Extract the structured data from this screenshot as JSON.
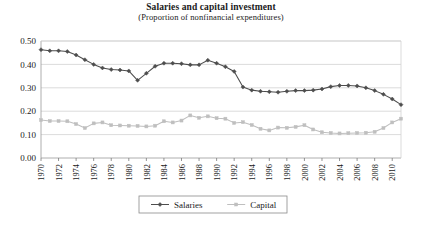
{
  "chart_data": {
    "type": "line",
    "title": "Salaries and capital investment",
    "subtitle": "(Proportion of nonfinancial expenditures)",
    "xlabel": "",
    "ylabel": "",
    "ylim": [
      0.0,
      0.5
    ],
    "ytick_values": [
      0.5,
      0.4,
      0.3,
      0.2,
      0.1,
      0.0
    ],
    "ytick_labels": [
      "0.50",
      "0.40",
      "0.30",
      "0.20",
      "0.10",
      "0.00"
    ],
    "xlim": [
      1970,
      2011
    ],
    "grid": "horizontal",
    "legend_position": "bottom-center",
    "x": [
      1970,
      1971,
      1972,
      1973,
      1974,
      1975,
      1976,
      1977,
      1978,
      1979,
      1980,
      1981,
      1982,
      1983,
      1984,
      1985,
      1986,
      1987,
      1988,
      1989,
      1990,
      1991,
      1992,
      1993,
      1994,
      1995,
      1996,
      1997,
      1998,
      1999,
      2000,
      2001,
      2002,
      2003,
      2004,
      2005,
      2006,
      2007,
      2008,
      2009,
      2010,
      2011
    ],
    "xtick_labels": [
      "1970",
      "1972",
      "1974",
      "1976",
      "1978",
      "1980",
      "1982",
      "1984",
      "1986",
      "1988",
      "1990",
      "1992",
      "1994",
      "1996",
      "1998",
      "2000",
      "2002",
      "2004",
      "2006",
      "2008",
      "2010"
    ],
    "series": [
      {
        "name": "Salaries",
        "color": "#4d4d4d",
        "marker": "diamond",
        "values": [
          0.463,
          0.458,
          0.458,
          0.455,
          0.44,
          0.42,
          0.4,
          0.385,
          0.378,
          0.376,
          0.372,
          0.332,
          0.362,
          0.392,
          0.405,
          0.405,
          0.403,
          0.398,
          0.398,
          0.418,
          0.405,
          0.39,
          0.37,
          0.303,
          0.29,
          0.285,
          0.283,
          0.281,
          0.285,
          0.288,
          0.288,
          0.29,
          0.295,
          0.305,
          0.31,
          0.31,
          0.308,
          0.3,
          0.288,
          0.272,
          0.252,
          0.228
        ]
      },
      {
        "name": "Capital",
        "color": "#bfbfbf",
        "marker": "square",
        "values": [
          0.162,
          0.158,
          0.158,
          0.157,
          0.145,
          0.128,
          0.148,
          0.152,
          0.14,
          0.139,
          0.138,
          0.137,
          0.135,
          0.138,
          0.157,
          0.152,
          0.16,
          0.182,
          0.172,
          0.178,
          0.17,
          0.168,
          0.15,
          0.153,
          0.141,
          0.125,
          0.118,
          0.13,
          0.129,
          0.133,
          0.14,
          0.122,
          0.11,
          0.107,
          0.105,
          0.106,
          0.107,
          0.108,
          0.112,
          0.128,
          0.152,
          0.168
        ]
      }
    ],
    "legend": [
      {
        "label": "Salaries",
        "color": "#4d4d4d",
        "marker": "diamond"
      },
      {
        "label": "Capital",
        "color": "#bfbfbf",
        "marker": "square"
      }
    ]
  }
}
